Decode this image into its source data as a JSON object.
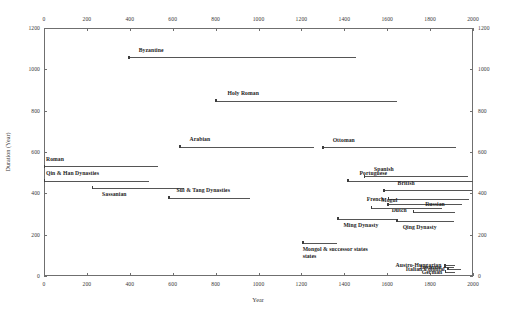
{
  "chart_data": {
    "type": "line",
    "title": "",
    "subtitle": "",
    "xlabel": "Year",
    "ylabel": "Duration (Year)",
    "xlim": [
      0,
      2000
    ],
    "ylim": [
      0,
      1200
    ],
    "xticks": [
      0,
      200,
      400,
      600,
      800,
      1000,
      1200,
      1400,
      1600,
      1800,
      2000
    ],
    "yticks": [
      0,
      200,
      400,
      600,
      800,
      1000,
      1200
    ],
    "xaxis_position": "both-top-and-bottom",
    "yaxis_position": "both-left-and-right",
    "grid": false,
    "legend": false,
    "series": [
      {
        "name": "Byzantine",
        "start_year": 395,
        "end_year": 1453,
        "duration": 1058,
        "label_align": "left",
        "label_offset_x": 10,
        "label_offset_y": -7
      },
      {
        "name": "Holy Roman",
        "start_year": 800,
        "end_year": 1648,
        "duration": 848,
        "label_align": "left",
        "label_offset_x": 12,
        "label_offset_y": -7
      },
      {
        "name": "Arabian",
        "start_year": 632,
        "end_year": 1258,
        "duration": 626,
        "label_align": "left",
        "label_offset_x": 10,
        "label_offset_y": -7
      },
      {
        "name": "Ottoman",
        "start_year": 1299,
        "end_year": 1922,
        "duration": 623,
        "label_align": "left",
        "label_offset_x": 10,
        "label_offset_y": -7
      },
      {
        "name": "Roman",
        "start_year": 0,
        "end_year": 530,
        "duration": 530,
        "label_align": "left",
        "label_offset_x": 2,
        "label_offset_y": -7
      },
      {
        "name": "Qin & Han Dynasties",
        "start_year": 0,
        "end_year": 490,
        "duration": 460,
        "label_align": "left",
        "label_offset_x": 2,
        "label_offset_y": -7
      },
      {
        "name": "Sassanian",
        "start_year": 224,
        "end_year": 651,
        "duration": 427,
        "label_align": "left",
        "label_offset_x": 10,
        "label_offset_y": 7
      },
      {
        "name": "Sui & Tang Dynasties",
        "start_year": 581,
        "end_year": 960,
        "duration": 379,
        "label_align": "left",
        "label_offset_x": 8,
        "label_offset_y": -7
      },
      {
        "name": "Spanish",
        "start_year": 1492,
        "end_year": 1975,
        "duration": 483,
        "label_align": "left",
        "label_offset_x": 10,
        "label_offset_y": -7
      },
      {
        "name": "Portuguese",
        "start_year": 1415,
        "end_year": 1999,
        "duration": 460,
        "label_align": "left",
        "label_offset_x": 12,
        "label_offset_y": -7
      },
      {
        "name": "British",
        "start_year": 1583,
        "end_year": 1997,
        "duration": 414,
        "label_align": "left",
        "label_offset_x": 14,
        "label_offset_y": -7
      },
      {
        "name": "French",
        "start_year": 1605,
        "end_year": 1980,
        "duration": 375,
        "label_align": "right",
        "label_offset_x": -4,
        "label_offset_y": 0
      },
      {
        "name": "Dutch",
        "start_year": 1602,
        "end_year": 1949,
        "duration": 347,
        "label_align": "left",
        "label_offset_x": 4,
        "label_offset_y": 6
      },
      {
        "name": "Mogul",
        "start_year": 1526,
        "end_year": 1857,
        "duration": 331,
        "label_align": "left",
        "label_offset_x": 10,
        "label_offset_y": -7
      },
      {
        "name": "Russian",
        "start_year": 1721,
        "end_year": 1917,
        "duration": 310,
        "label_align": "left",
        "label_offset_x": 12,
        "label_offset_y": -7
      },
      {
        "name": "Ming Dynasty",
        "start_year": 1368,
        "end_year": 1644,
        "duration": 276,
        "label_align": "left",
        "label_offset_x": 6,
        "label_offset_y": 7
      },
      {
        "name": "Qing Dynasty",
        "start_year": 1644,
        "end_year": 1912,
        "duration": 268,
        "label_align": "left",
        "label_offset_x": 6,
        "label_offset_y": 7
      },
      {
        "name": "Mongol & successor states",
        "start_year": 1206,
        "end_year": 1368,
        "duration": 162,
        "label_align": "left",
        "label_offset_x": 0,
        "label_offset_y": 7,
        "label_line2": "states"
      },
      {
        "name": "Austro-Hungarian",
        "start_year": 1867,
        "end_year": 1918,
        "duration": 51,
        "label_align": "right",
        "label_offset_x": -3,
        "label_offset_y": 0
      },
      {
        "name": "Japanese",
        "start_year": 1868,
        "end_year": 1912,
        "duration": 44,
        "label_align": "right",
        "label_offset_x": -3,
        "label_offset_y": 0
      },
      {
        "name": "Italian Colonial",
        "start_year": 1882,
        "end_year": 1943,
        "duration": 36,
        "label_align": "right",
        "label_offset_x": -3,
        "label_offset_y": 0
      },
      {
        "name": "German",
        "start_year": 1871,
        "end_year": 1918,
        "duration": 20,
        "label_align": "right",
        "label_offset_x": -3,
        "label_offset_y": 0
      }
    ]
  },
  "axes": {
    "x_title": "Year",
    "y_title": "Duration (Year)",
    "x_tick_labels": [
      "0",
      "200",
      "400",
      "600",
      "800",
      "1000",
      "1200",
      "1400",
      "1600",
      "1800",
      "2000"
    ],
    "y_tick_labels": [
      "0",
      "200",
      "400",
      "600",
      "800",
      "1000",
      "1200"
    ]
  },
  "colors": {
    "line": "#555555",
    "axis": "#6f6f6f",
    "text": "#1d1d1d",
    "background": "#ffffff"
  }
}
